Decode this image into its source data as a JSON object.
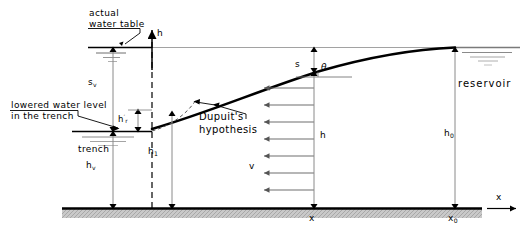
{
  "diagram": {
    "type": "cross-section-schematic",
    "colors": {
      "line": "#000000",
      "thin_line": "#888888",
      "ground_fill": "#b8b8b8",
      "background": "#ffffff"
    },
    "labels": {
      "actual_water_table_line1": "actual",
      "actual_water_table_line2": "water table",
      "lowered_level_line1": "lowered water level",
      "lowered_level_line2": "in  the  trench",
      "trench": "trench",
      "dupuit_line1": "Dupuit's",
      "dupuit_line2": "hypothesis",
      "reservoir": "reservoir",
      "axis_h": "h",
      "axis_x": "x",
      "theta": "θ",
      "velocity": "v",
      "head_h": "h",
      "drawdown_s": "s",
      "drawdown_sv": "s",
      "drawdown_sv_sub": "v",
      "h_v": "h",
      "h_v_sub": "v",
      "h_1": "h",
      "h_1_sub": "1",
      "h_r_prime": "h",
      "h_r_prime_sub": "r",
      "h_0": "h",
      "h_0_sub": "0",
      "x_at_section": "x",
      "x_0": "x",
      "x_0_sub": "0"
    },
    "dimensions": [
      {
        "name": "s_v",
        "description": "drawdown at the trench, from actual water table to lowered water level"
      },
      {
        "name": "h_v",
        "description": "head at the trench above the impervious base"
      },
      {
        "name": "h_r_prime",
        "description": "seepage face height at the trench wall"
      },
      {
        "name": "h_1",
        "description": "head at the trench face on the Dupuit curve"
      },
      {
        "name": "h",
        "description": "head at distance x above the impervious base"
      },
      {
        "name": "s",
        "description": "drawdown at distance x below the reservoir level"
      },
      {
        "name": "h_0",
        "description": "reservoir head above the impervious base at x0"
      }
    ],
    "arrow_count_velocity": 6
  }
}
